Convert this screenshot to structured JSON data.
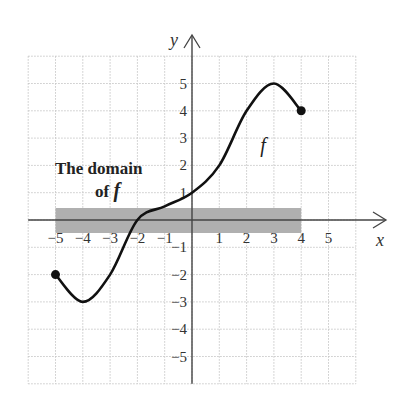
{
  "chart_data": {
    "type": "line",
    "title": "",
    "xlabel": "x",
    "ylabel": "y",
    "xlim": [
      -6,
      6
    ],
    "ylim": [
      -6,
      6
    ],
    "grid": true,
    "x_ticks": [
      -5,
      -4,
      -3,
      -2,
      -1,
      1,
      2,
      3,
      4,
      5
    ],
    "y_ticks": [
      5,
      4,
      3,
      2,
      1,
      -1,
      -2,
      -3,
      -4,
      -5
    ],
    "series": [
      {
        "name": "f",
        "x": [
          -5,
          -4,
          -3,
          -2,
          -1,
          0,
          1,
          2,
          3,
          4
        ],
        "y": [
          -2,
          -3,
          -2,
          0,
          0.5,
          1,
          2,
          4,
          5,
          4
        ],
        "endpoints": [
          {
            "x": -5,
            "y": -2,
            "closed": true
          },
          {
            "x": 4,
            "y": 4,
            "closed": true
          }
        ]
      }
    ],
    "shaded_region": {
      "x_from": -5,
      "x_to": 4,
      "label": "The domain of f",
      "color": "#b0b0b0"
    },
    "annotations": [
      {
        "text_line1": "The domain",
        "text_line2": "of",
        "text_f": "f"
      },
      {
        "text": "f",
        "x": 2.5,
        "y": 2.5
      }
    ]
  }
}
